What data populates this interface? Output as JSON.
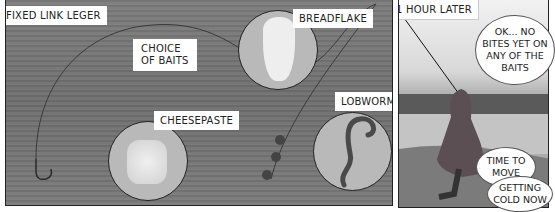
{
  "panel_left": {
    "labels": {
      "fixed_link_leger": "FIXED LINK LEGER",
      "choice_of_baits_line1": "CHOICE",
      "choice_of_baits_line2": "OF BAITS",
      "breadflake": "BREADFLAKE",
      "cheesepaste": "CHEESEPASTE",
      "lobworm": "LOBWORM"
    }
  },
  "panel_right": {
    "caption": "1 HOUR LATER",
    "bubbles": [
      {
        "lines": [
          "OK... NO",
          "BITES YET ON",
          "ANY OF THE",
          "BAITS"
        ]
      },
      {
        "lines": [
          "TIME TO",
          "MOVE"
        ]
      },
      {
        "lines": [
          "GETTING",
          "COLD NOW"
        ]
      }
    ]
  },
  "colors": {
    "table_wood": "#757575",
    "bait_circle": "#b9b9b9",
    "label_bg": "#ffffff",
    "ink": "#222222"
  }
}
